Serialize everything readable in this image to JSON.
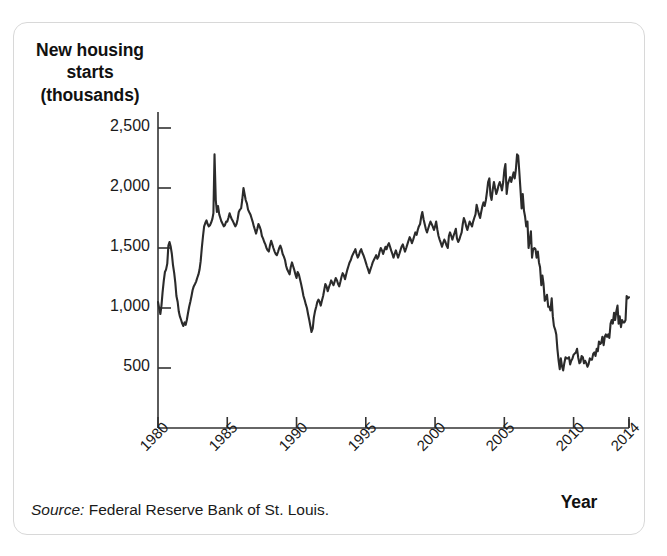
{
  "figure": {
    "y_axis_title_lines": [
      "New housing",
      "starts",
      "(thousands)"
    ],
    "x_axis_title": "Year",
    "source_label": "Source:",
    "source_text": "Federal Reserve Bank of St. Louis.",
    "line_color": "#2b2b2b",
    "axis_color": "#333333",
    "border_color": "#d8d8d8",
    "background": "#ffffff"
  },
  "chart_data": {
    "type": "line",
    "title": "",
    "xlabel": "Year",
    "ylabel": "New housing starts (thousands)",
    "xlim": [
      1980,
      2014
    ],
    "ylim": [
      0,
      2600
    ],
    "grid": false,
    "legend": false,
    "y_ticks": [
      500,
      1000,
      1500,
      2000,
      2500
    ],
    "y_tick_labels": [
      "500",
      "1,000",
      "1,500",
      "2,000",
      "2,500"
    ],
    "x_ticks": [
      1980,
      1985,
      1990,
      1995,
      2000,
      2005,
      2010,
      2014
    ],
    "x_tick_labels": [
      "1980",
      "1985",
      "1990",
      "1995",
      "2000",
      "2005",
      "2010",
      "2014"
    ],
    "series": [
      {
        "name": "New housing starts",
        "units": "thousands of units, seasonally adjusted annual rate",
        "x": [
          1980.0,
          1980.08,
          1980.17,
          1980.25,
          1980.33,
          1980.42,
          1980.5,
          1980.58,
          1980.67,
          1980.75,
          1980.83,
          1980.92,
          1981.0,
          1981.08,
          1981.17,
          1981.25,
          1981.33,
          1981.42,
          1981.5,
          1981.58,
          1981.67,
          1981.75,
          1981.83,
          1981.92,
          1982.0,
          1982.08,
          1982.17,
          1982.25,
          1982.33,
          1982.42,
          1982.5,
          1982.58,
          1982.67,
          1982.75,
          1982.83,
          1982.92,
          1983.0,
          1983.08,
          1983.17,
          1983.25,
          1983.33,
          1983.42,
          1983.5,
          1983.58,
          1983.67,
          1983.75,
          1983.83,
          1983.92,
          1984.0,
          1984.08,
          1984.17,
          1984.25,
          1984.33,
          1984.42,
          1984.5,
          1984.58,
          1984.67,
          1984.75,
          1984.83,
          1984.92,
          1985.0,
          1985.08,
          1985.17,
          1985.25,
          1985.33,
          1985.42,
          1985.5,
          1985.58,
          1985.67,
          1985.75,
          1985.83,
          1985.92,
          1986.0,
          1986.08,
          1986.17,
          1986.25,
          1986.33,
          1986.42,
          1986.5,
          1986.58,
          1986.67,
          1986.75,
          1986.83,
          1986.92,
          1987.0,
          1987.08,
          1987.17,
          1987.25,
          1987.33,
          1987.42,
          1987.5,
          1987.58,
          1987.67,
          1987.75,
          1987.83,
          1987.92,
          1988.0,
          1988.08,
          1988.17,
          1988.25,
          1988.33,
          1988.42,
          1988.5,
          1988.58,
          1988.67,
          1988.75,
          1988.83,
          1988.92,
          1989.0,
          1989.08,
          1989.17,
          1989.25,
          1989.33,
          1989.42,
          1989.5,
          1989.58,
          1989.67,
          1989.75,
          1989.83,
          1989.92,
          1990.0,
          1990.08,
          1990.17,
          1990.25,
          1990.33,
          1990.42,
          1990.5,
          1990.58,
          1990.67,
          1990.75,
          1990.83,
          1990.92,
          1991.0,
          1991.08,
          1991.17,
          1991.25,
          1991.33,
          1991.42,
          1991.5,
          1991.58,
          1991.67,
          1991.75,
          1991.83,
          1991.92,
          1992.0,
          1992.08,
          1992.17,
          1992.25,
          1992.33,
          1992.42,
          1992.5,
          1992.58,
          1992.67,
          1992.75,
          1992.83,
          1992.92,
          1993.0,
          1993.08,
          1993.17,
          1993.25,
          1993.33,
          1993.42,
          1993.5,
          1993.58,
          1993.67,
          1993.75,
          1993.83,
          1993.92,
          1994.0,
          1994.08,
          1994.17,
          1994.25,
          1994.33,
          1994.42,
          1994.5,
          1994.58,
          1994.67,
          1994.75,
          1994.83,
          1994.92,
          1995.0,
          1995.08,
          1995.17,
          1995.25,
          1995.33,
          1995.42,
          1995.5,
          1995.58,
          1995.67,
          1995.75,
          1995.83,
          1995.92,
          1996.0,
          1996.08,
          1996.17,
          1996.25,
          1996.33,
          1996.42,
          1996.5,
          1996.58,
          1996.67,
          1996.75,
          1996.83,
          1996.92,
          1997.0,
          1997.08,
          1997.17,
          1997.25,
          1997.33,
          1997.42,
          1997.5,
          1997.58,
          1997.67,
          1997.75,
          1997.83,
          1997.92,
          1998.0,
          1998.08,
          1998.17,
          1998.25,
          1998.33,
          1998.42,
          1998.5,
          1998.58,
          1998.67,
          1998.75,
          1998.83,
          1998.92,
          1999.0,
          1999.08,
          1999.17,
          1999.25,
          1999.33,
          1999.42,
          1999.5,
          1999.58,
          1999.67,
          1999.75,
          1999.83,
          1999.92,
          2000.0,
          2000.08,
          2000.17,
          2000.25,
          2000.33,
          2000.42,
          2000.5,
          2000.58,
          2000.67,
          2000.75,
          2000.83,
          2000.92,
          2001.0,
          2001.08,
          2001.17,
          2001.25,
          2001.33,
          2001.42,
          2001.5,
          2001.58,
          2001.67,
          2001.75,
          2001.83,
          2001.92,
          2002.0,
          2002.08,
          2002.17,
          2002.25,
          2002.33,
          2002.42,
          2002.5,
          2002.58,
          2002.67,
          2002.75,
          2002.83,
          2002.92,
          2003.0,
          2003.08,
          2003.17,
          2003.25,
          2003.33,
          2003.42,
          2003.5,
          2003.58,
          2003.67,
          2003.75,
          2003.83,
          2003.92,
          2004.0,
          2004.08,
          2004.17,
          2004.25,
          2004.33,
          2004.42,
          2004.5,
          2004.58,
          2004.67,
          2004.75,
          2004.83,
          2004.92,
          2005.0,
          2005.08,
          2005.17,
          2005.25,
          2005.33,
          2005.42,
          2005.5,
          2005.58,
          2005.67,
          2005.75,
          2005.83,
          2005.92,
          2006.0,
          2006.08,
          2006.17,
          2006.25,
          2006.33,
          2006.42,
          2006.5,
          2006.58,
          2006.67,
          2006.75,
          2006.83,
          2006.92,
          2007.0,
          2007.08,
          2007.17,
          2007.25,
          2007.33,
          2007.42,
          2007.5,
          2007.58,
          2007.67,
          2007.75,
          2007.83,
          2007.92,
          2008.0,
          2008.08,
          2008.17,
          2008.25,
          2008.33,
          2008.42,
          2008.5,
          2008.58,
          2008.67,
          2008.75,
          2008.83,
          2008.92,
          2009.0,
          2009.08,
          2009.17,
          2009.25,
          2009.33,
          2009.42,
          2009.5,
          2009.58,
          2009.67,
          2009.75,
          2009.83,
          2009.92,
          2010.0,
          2010.08,
          2010.17,
          2010.25,
          2010.33,
          2010.42,
          2010.5,
          2010.58,
          2010.67,
          2010.75,
          2010.83,
          2010.92,
          2011.0,
          2011.08,
          2011.17,
          2011.25,
          2011.33,
          2011.42,
          2011.5,
          2011.58,
          2011.67,
          2011.75,
          2011.83,
          2011.92,
          2012.0,
          2012.08,
          2012.17,
          2012.25,
          2012.33,
          2012.42,
          2012.5,
          2012.58,
          2012.67,
          2012.75,
          2012.83,
          2012.92,
          2013.0,
          2013.08,
          2013.17,
          2013.25,
          2013.33,
          2013.42,
          2013.5,
          2013.58,
          2013.67,
          2013.75,
          2013.83,
          2013.92,
          2014.0
        ],
        "values": [
          1050,
          1000,
          950,
          1020,
          1130,
          1230,
          1300,
          1320,
          1370,
          1520,
          1550,
          1510,
          1450,
          1360,
          1290,
          1210,
          1100,
          1050,
          970,
          930,
          900,
          870,
          850,
          880,
          860,
          900,
          960,
          1010,
          1050,
          1100,
          1150,
          1180,
          1200,
          1220,
          1250,
          1280,
          1320,
          1390,
          1510,
          1600,
          1680,
          1710,
          1730,
          1700,
          1680,
          1690,
          1710,
          1740,
          1790,
          2280,
          1900,
          1800,
          1850,
          1780,
          1750,
          1720,
          1700,
          1680,
          1690,
          1720,
          1720,
          1750,
          1790,
          1760,
          1740,
          1720,
          1700,
          1680,
          1700,
          1740,
          1800,
          1820,
          1830,
          1900,
          2000,
          1950,
          1900,
          1870,
          1820,
          1800,
          1780,
          1750,
          1720,
          1680,
          1650,
          1620,
          1660,
          1700,
          1680,
          1650,
          1600,
          1580,
          1550,
          1530,
          1500,
          1480,
          1470,
          1520,
          1560,
          1530,
          1500,
          1470,
          1450,
          1440,
          1470,
          1500,
          1520,
          1490,
          1450,
          1430,
          1400,
          1350,
          1320,
          1300,
          1280,
          1340,
          1380,
          1350,
          1320,
          1280,
          1250,
          1300,
          1280,
          1240,
          1200,
          1150,
          1100,
          1070,
          1030,
          1000,
          950,
          900,
          850,
          800,
          830,
          920,
          970,
          1010,
          1050,
          1070,
          1050,
          1020,
          1060,
          1100,
          1150,
          1200,
          1180,
          1140,
          1170,
          1200,
          1230,
          1210,
          1190,
          1220,
          1250,
          1230,
          1200,
          1180,
          1220,
          1260,
          1290,
          1270,
          1240,
          1280,
          1320,
          1350,
          1380,
          1400,
          1430,
          1450,
          1470,
          1490,
          1450,
          1420,
          1440,
          1470,
          1490,
          1460,
          1440,
          1410,
          1380,
          1350,
          1320,
          1290,
          1320,
          1350,
          1380,
          1400,
          1420,
          1440,
          1410,
          1430,
          1470,
          1500,
          1480,
          1450,
          1480,
          1510,
          1490,
          1520,
          1540,
          1510,
          1480,
          1450,
          1420,
          1450,
          1480,
          1450,
          1420,
          1450,
          1480,
          1510,
          1530,
          1500,
          1470,
          1500,
          1530,
          1560,
          1590,
          1570,
          1540,
          1570,
          1600,
          1630,
          1610,
          1650,
          1680,
          1700,
          1760,
          1800,
          1740,
          1700,
          1660,
          1630,
          1660,
          1690,
          1720,
          1700,
          1680,
          1650,
          1680,
          1720,
          1650,
          1600,
          1570,
          1540,
          1510,
          1540,
          1570,
          1550,
          1520,
          1500,
          1600,
          1630,
          1600,
          1570,
          1600,
          1630,
          1660,
          1580,
          1550,
          1570,
          1600,
          1630,
          1700,
          1750,
          1720,
          1680,
          1650,
          1690,
          1720,
          1700,
          1680,
          1720,
          1750,
          1780,
          1860,
          1820,
          1780,
          1750,
          1800,
          1850,
          1880,
          1850,
          1900,
          1970,
          2050,
          2080,
          1940,
          1900,
          1990,
          2050,
          2000,
          1950,
          1980,
          2020,
          2050,
          2020,
          1980,
          2050,
          2150,
          2200,
          1950,
          2030,
          2060,
          2090,
          2050,
          2090,
          2130,
          2080,
          2150,
          2280,
          2270,
          2140,
          1980,
          1830,
          1950,
          1810,
          1760,
          1680,
          1720,
          1500,
          1560,
          1640,
          1420,
          1490,
          1500,
          1490,
          1420,
          1470,
          1380,
          1340,
          1190,
          1270,
          1200,
          1060,
          1080,
          1110,
          1010,
          1010,
          980,
          1080,
          930,
          850,
          820,
          780,
          660,
          560,
          490,
          580,
          510,
          480,
          540,
          590,
          580,
          580,
          590,
          530,
          560,
          580,
          610,
          620,
          630,
          660,
          590,
          540,
          550,
          600,
          590,
          540,
          560,
          540,
          510,
          530,
          580,
          570,
          570,
          620,
          630,
          600,
          660,
          640,
          720,
          700,
          710,
          760,
          690,
          760,
          780,
          760,
          780,
          750,
          870,
          900,
          870,
          960,
          900,
          970,
          1020,
          870,
          930,
          840,
          900,
          880,
          880,
          900,
          1100,
          1080,
          1090
        ]
      }
    ],
    "key_points": [
      {
        "label": "1984 spike peak",
        "x": 1984.08,
        "y": 2280
      },
      {
        "label": "1982 trough",
        "x": 1981.83,
        "y": 850
      },
      {
        "label": "1991 trough",
        "x": 1991.08,
        "y": 800
      },
      {
        "label": "2006 peak",
        "x": 2005.92,
        "y": 2280
      },
      {
        "label": "2009 trough",
        "x": 2009.0,
        "y": 490
      }
    ]
  }
}
